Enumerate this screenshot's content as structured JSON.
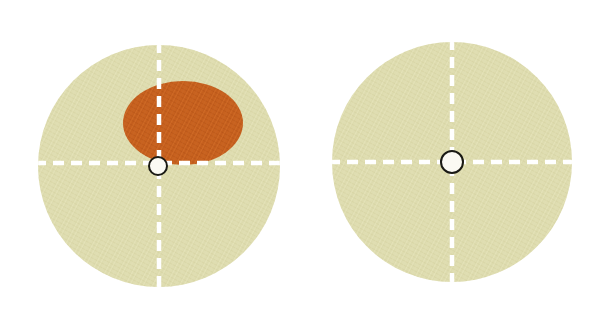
{
  "figure": {
    "title": "",
    "background_color": "#ffffff",
    "width": 600,
    "height": 325,
    "colors": {
      "disc_fill": "#dfddb1",
      "disc_fill_shade": "#d6d4a5",
      "lesion_fill": "#c8621f",
      "lesion_fill_shade": "#bc5a1b",
      "dash_line": "#ffffff",
      "hole_fill": "#fbfaf3",
      "hole_stroke": "#1a1a14"
    },
    "panels": [
      {
        "id": "panel-left",
        "label": "",
        "disc": {
          "name": "fabric-disc",
          "cx": 159,
          "cy": 166,
          "r": 121,
          "fill": "#dfddb1"
        },
        "crosshair": {
          "name": "crosshair-dashed-lines",
          "vertical": {
            "x": 159,
            "y1": 45,
            "y2": 288
          },
          "horizontal": {
            "y": 163,
            "x1": 38,
            "x2": 281
          },
          "dash_length": 10,
          "dash_gap": 7,
          "stroke_width": 4,
          "color": "#ffffff"
        },
        "center_hole": {
          "name": "center-hole",
          "cx": 158,
          "cy": 166,
          "r": 9,
          "fill": "#fbfaf3",
          "stroke": "#1a1a14",
          "stroke_width": 2
        },
        "lesion": {
          "name": "lesion-ellipse",
          "present": true,
          "cx": 183,
          "cy": 123,
          "rx": 60,
          "ry": 42,
          "fill": "#c8621f",
          "quadrant": "upper-right"
        }
      },
      {
        "id": "panel-right",
        "label": "",
        "disc": {
          "name": "fabric-disc",
          "cx": 452,
          "cy": 162,
          "r": 120,
          "fill": "#dfddb1"
        },
        "crosshair": {
          "name": "crosshair-dashed-lines",
          "vertical": {
            "x": 452,
            "y1": 42,
            "y2": 283
          },
          "horizontal": {
            "y": 162,
            "x1": 332,
            "x2": 573
          },
          "dash_length": 10,
          "dash_gap": 7,
          "stroke_width": 4,
          "color": "#ffffff"
        },
        "center_hole": {
          "name": "center-hole",
          "cx": 452,
          "cy": 162,
          "r": 11,
          "fill": "#fbfaf3",
          "stroke": "#1a1a14",
          "stroke_width": 2
        },
        "lesion": {
          "name": "lesion-ellipse",
          "present": false
        }
      }
    ]
  }
}
